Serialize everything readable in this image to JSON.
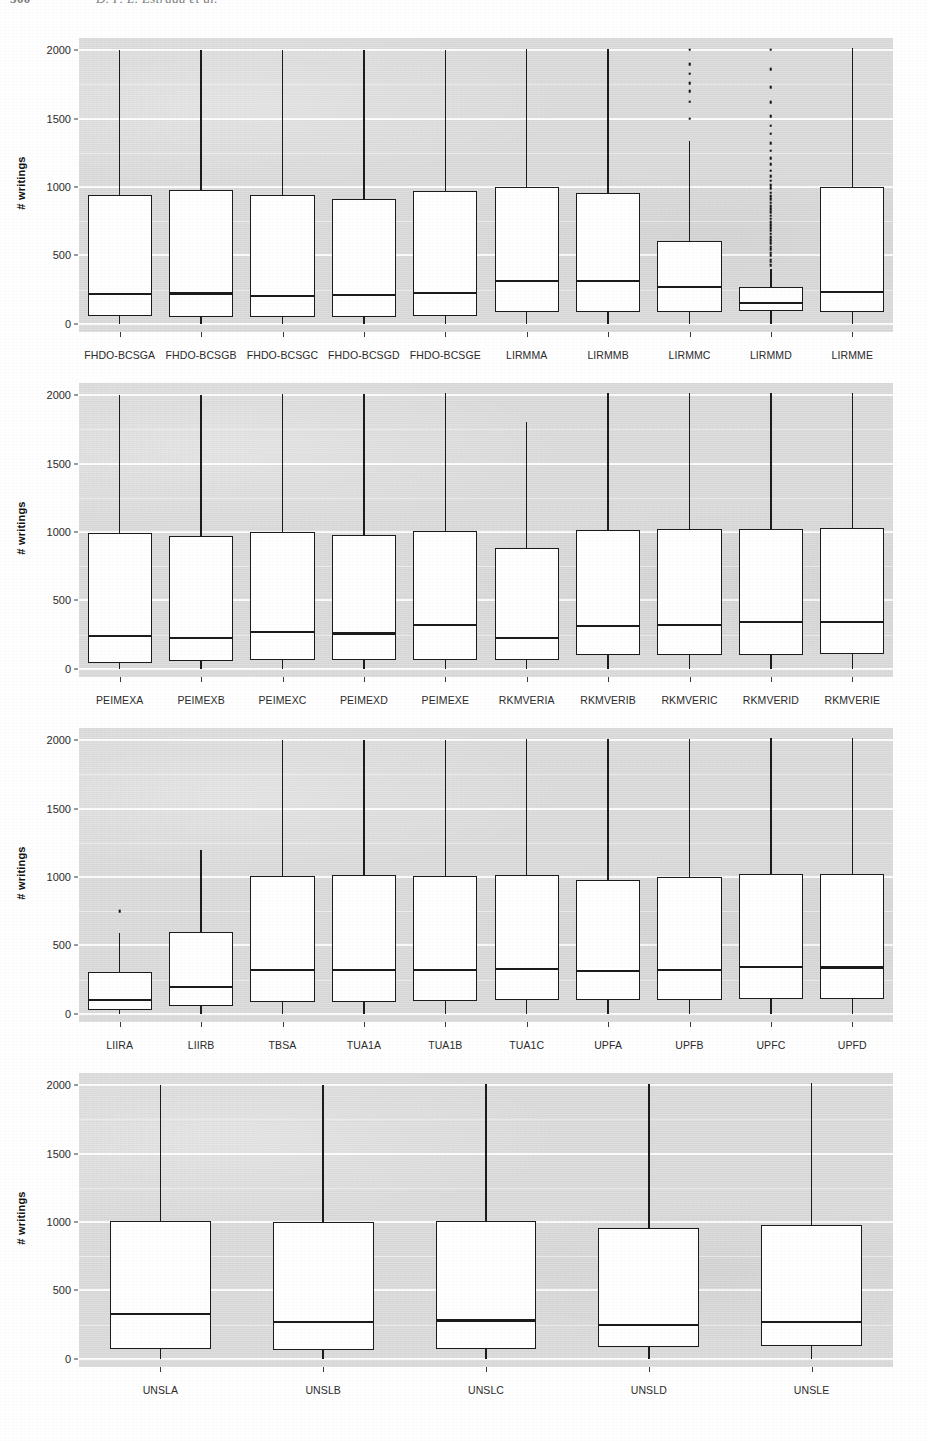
{
  "page": {
    "folio": "300",
    "running_head": "D. P. L. Estrada et al."
  },
  "axis": {
    "y_label": "# writings",
    "y_ticks": [
      0,
      500,
      1000,
      1500,
      2000
    ],
    "y_tick_labels": [
      "0",
      "500",
      "1000",
      "1500",
      "2000"
    ],
    "y_min": -60,
    "y_max": 2090,
    "grid_minor": [
      250,
      750,
      1250,
      1750
    ]
  },
  "chart_data": [
    {
      "type": "box",
      "panel": 1,
      "title": "",
      "xlabel": "",
      "ylabel": "# writings",
      "ylim": [
        0,
        2000
      ],
      "grid": true,
      "categories": [
        "FHDO-BCSGA",
        "FHDO-BCSGB",
        "FHDO-BCSGC",
        "FHDO-BCSGD",
        "FHDO-BCSGE",
        "LIRMMA",
        "LIRMMB",
        "LIRMMC",
        "LIRMMD",
        "LIRMME"
      ],
      "boxes": [
        {
          "label": "FHDO-BCSGA",
          "q1": 55,
          "median": 220,
          "q3": 945,
          "whisker_low": 0,
          "whisker_high": 2000,
          "outliers": []
        },
        {
          "label": "FHDO-BCSGB",
          "q1": 50,
          "median": 222,
          "q3": 975,
          "whisker_low": 0,
          "whisker_high": 2000,
          "outliers": []
        },
        {
          "label": "FHDO-BCSGC",
          "q1": 52,
          "median": 205,
          "q3": 945,
          "whisker_low": 0,
          "whisker_high": 2000,
          "outliers": []
        },
        {
          "label": "FHDO-BCSGD",
          "q1": 50,
          "median": 208,
          "q3": 910,
          "whisker_low": 0,
          "whisker_high": 2000,
          "outliers": []
        },
        {
          "label": "FHDO-BCSGE",
          "q1": 60,
          "median": 228,
          "q3": 972,
          "whisker_low": 0,
          "whisker_high": 2000,
          "outliers": []
        },
        {
          "label": "LIRMMA",
          "q1": 85,
          "median": 315,
          "q3": 1000,
          "whisker_low": 0,
          "whisker_high": 2010,
          "outliers": []
        },
        {
          "label": "LIRMMB",
          "q1": 85,
          "median": 312,
          "q3": 960,
          "whisker_low": 0,
          "whisker_high": 2010,
          "outliers": []
        },
        {
          "label": "LIRMMC",
          "q1": 88,
          "median": 270,
          "q3": 605,
          "whisker_low": 0,
          "whisker_high": 1340,
          "outliers": [
            1500,
            1625,
            1700,
            1760,
            1830,
            1900,
            2005
          ]
        },
        {
          "label": "LIRMMD",
          "q1": 90,
          "median": 150,
          "q3": 270,
          "whisker_low": 0,
          "whisker_high": 400,
          "outliers": [
            430,
            455,
            470,
            500,
            520,
            545,
            565,
            590,
            610,
            635,
            660,
            680,
            700,
            720,
            745,
            770,
            790,
            815,
            840,
            860,
            885,
            910,
            935,
            960,
            990,
            1015,
            1045,
            1080,
            1120,
            1165,
            1210,
            1265,
            1320,
            1390,
            1450,
            1520,
            1620,
            1730,
            1860,
            2005
          ]
        },
        {
          "label": "LIRMME",
          "q1": 88,
          "median": 235,
          "q3": 1000,
          "whisker_low": 0,
          "whisker_high": 2015,
          "outliers": []
        }
      ]
    },
    {
      "type": "box",
      "panel": 2,
      "title": "",
      "xlabel": "",
      "ylabel": "# writings",
      "ylim": [
        0,
        2000
      ],
      "grid": true,
      "categories": [
        "PEIMEXA",
        "PEIMEXB",
        "PEIMEXC",
        "PEIMEXD",
        "PEIMEXE",
        "RKMVERIA",
        "RKMVERIB",
        "RKMVERIC",
        "RKMVERID",
        "RKMVERIE"
      ],
      "boxes": [
        {
          "label": "PEIMEXA",
          "q1": 42,
          "median": 240,
          "q3": 995,
          "whisker_low": 0,
          "whisker_high": 2005,
          "outliers": []
        },
        {
          "label": "PEIMEXB",
          "q1": 55,
          "median": 228,
          "q3": 970,
          "whisker_low": 0,
          "whisker_high": 2005,
          "outliers": []
        },
        {
          "label": "PEIMEXC",
          "q1": 62,
          "median": 268,
          "q3": 1000,
          "whisker_low": 0,
          "whisker_high": 2010,
          "outliers": []
        },
        {
          "label": "PEIMEXD",
          "q1": 62,
          "median": 258,
          "q3": 980,
          "whisker_low": 0,
          "whisker_high": 2010,
          "outliers": []
        },
        {
          "label": "PEIMEXE",
          "q1": 62,
          "median": 318,
          "q3": 1010,
          "whisker_low": 0,
          "whisker_high": 2015,
          "outliers": []
        },
        {
          "label": "RKMVERIA",
          "q1": 62,
          "median": 225,
          "q3": 880,
          "whisker_low": 0,
          "whisker_high": 1805,
          "outliers": []
        },
        {
          "label": "RKMVERIB",
          "q1": 98,
          "median": 315,
          "q3": 1015,
          "whisker_low": 0,
          "whisker_high": 2020,
          "outliers": []
        },
        {
          "label": "RKMVERIC",
          "q1": 100,
          "median": 318,
          "q3": 1022,
          "whisker_low": 0,
          "whisker_high": 2020,
          "outliers": []
        },
        {
          "label": "RKMVERID",
          "q1": 102,
          "median": 340,
          "q3": 1020,
          "whisker_low": 0,
          "whisker_high": 2020,
          "outliers": []
        },
        {
          "label": "RKMVERIE",
          "q1": 105,
          "median": 340,
          "q3": 1030,
          "whisker_low": 0,
          "whisker_high": 2020,
          "outliers": []
        }
      ]
    },
    {
      "type": "box",
      "panel": 3,
      "title": "",
      "xlabel": "",
      "ylabel": "# writings",
      "ylim": [
        0,
        2000
      ],
      "grid": true,
      "categories": [
        "LIIRA",
        "LIIRB",
        "TBSA",
        "TUA1A",
        "TUA1B",
        "TUA1C",
        "UPFA",
        "UPFB",
        "UPFC",
        "UPFD"
      ],
      "boxes": [
        {
          "label": "LIIRA",
          "q1": 28,
          "median": 100,
          "q3": 305,
          "whisker_low": 0,
          "whisker_high": 590,
          "outliers": [
            750
          ]
        },
        {
          "label": "LIIRB",
          "q1": 55,
          "median": 195,
          "q3": 600,
          "whisker_low": 0,
          "whisker_high": 1200,
          "outliers": []
        },
        {
          "label": "TBSA",
          "q1": 85,
          "median": 322,
          "q3": 1010,
          "whisker_low": 0,
          "whisker_high": 2000,
          "outliers": []
        },
        {
          "label": "TUA1A",
          "q1": 85,
          "median": 322,
          "q3": 1015,
          "whisker_low": 0,
          "whisker_high": 2005,
          "outliers": []
        },
        {
          "label": "TUA1B",
          "q1": 90,
          "median": 318,
          "q3": 1008,
          "whisker_low": 0,
          "whisker_high": 2005,
          "outliers": []
        },
        {
          "label": "TUA1C",
          "q1": 98,
          "median": 328,
          "q3": 1015,
          "whisker_low": 0,
          "whisker_high": 2010,
          "outliers": []
        },
        {
          "label": "UPFA",
          "q1": 100,
          "median": 315,
          "q3": 975,
          "whisker_low": 0,
          "whisker_high": 2010,
          "outliers": []
        },
        {
          "label": "UPFB",
          "q1": 100,
          "median": 318,
          "q3": 1000,
          "whisker_low": 0,
          "whisker_high": 2010,
          "outliers": []
        },
        {
          "label": "UPFC",
          "q1": 105,
          "median": 340,
          "q3": 1020,
          "whisker_low": 0,
          "whisker_high": 2015,
          "outliers": []
        },
        {
          "label": "UPFD",
          "q1": 105,
          "median": 338,
          "q3": 1020,
          "whisker_low": 0,
          "whisker_high": 2015,
          "outliers": []
        }
      ]
    },
    {
      "type": "box",
      "panel": 4,
      "title": "",
      "xlabel": "",
      "ylabel": "# writings",
      "ylim": [
        0,
        2000
      ],
      "grid": true,
      "categories": [
        "UNSLA",
        "UNSLB",
        "UNSLC",
        "UNSLD",
        "UNSLE"
      ],
      "boxes": [
        {
          "label": "UNSLA",
          "q1": 75,
          "median": 328,
          "q3": 1010,
          "whisker_low": 0,
          "whisker_high": 2000,
          "outliers": []
        },
        {
          "label": "UNSLB",
          "q1": 62,
          "median": 272,
          "q3": 1000,
          "whisker_low": 0,
          "whisker_high": 2005,
          "outliers": []
        },
        {
          "label": "UNSLC",
          "q1": 68,
          "median": 280,
          "q3": 1010,
          "whisker_low": 0,
          "whisker_high": 2010,
          "outliers": []
        },
        {
          "label": "UNSLD",
          "q1": 88,
          "median": 248,
          "q3": 960,
          "whisker_low": 0,
          "whisker_high": 2010,
          "outliers": []
        },
        {
          "label": "UNSLE",
          "q1": 95,
          "median": 268,
          "q3": 975,
          "whisker_low": 0,
          "whisker_high": 2015,
          "outliers": []
        }
      ]
    }
  ],
  "panel_layout": [
    {
      "plot_x": 79,
      "plot_y": 38,
      "plot_w": 814,
      "plot_h": 294,
      "label_y": 349
    },
    {
      "plot_x": 79,
      "plot_y": 383,
      "plot_w": 814,
      "plot_h": 294,
      "label_y": 694
    },
    {
      "plot_x": 79,
      "plot_y": 728,
      "plot_w": 814,
      "plot_h": 294,
      "label_y": 1039
    },
    {
      "plot_x": 79,
      "plot_y": 1073,
      "plot_w": 814,
      "plot_h": 294,
      "label_y": 1384
    }
  ]
}
